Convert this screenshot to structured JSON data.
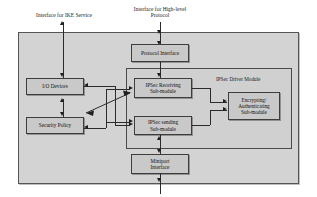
{
  "diagram": {
    "external_labels": [
      {
        "id": "ike",
        "text": "Interface for IKE Service"
      },
      {
        "id": "highlevel",
        "text": "Interface for High-level\nProtocol"
      }
    ],
    "containers": [
      {
        "id": "system",
        "label": ""
      },
      {
        "id": "driver-module",
        "label": "IPSec Driver Module"
      }
    ],
    "blocks": [
      {
        "id": "protocol-interface",
        "label": "Protocol Interface"
      },
      {
        "id": "io-devices",
        "label": "I/O Devices"
      },
      {
        "id": "security-policy",
        "label": "Security Policy"
      },
      {
        "id": "ipsec-receiving",
        "label": "IPSec Receiving\nSub-module"
      },
      {
        "id": "ipsec-sending",
        "label": "IPSec sending\nSub-module"
      },
      {
        "id": "encrypting-authenticating",
        "label": "Encrypting/\nAuthenticating\nSub-module"
      },
      {
        "id": "miniport-interface",
        "label": "Miniport\nInterface"
      }
    ],
    "colors": {
      "outer_fill": "#d3d3d3",
      "inner_fill": "#d0d0d0",
      "box_fill": "#c9c9c9",
      "line": "#2b2b2b",
      "text": "#111111"
    }
  }
}
